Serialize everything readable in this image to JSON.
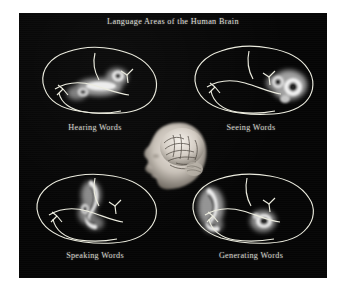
{
  "figure": {
    "title": "Language Areas of the Human Brain",
    "background_color": "#ffffff",
    "panel_color": "#050505",
    "text_color": "#d8d8d0",
    "activation_color": "#ffffff",
    "outline_color": "#e8e8e0"
  },
  "panels": [
    {
      "id": "hearing-words",
      "caption": "Hearing Words",
      "position": "top-left",
      "brain_view": "left lateral sagittal outline",
      "activation_region": "superior temporal gyrus / auditory cortex",
      "activation_location": "mid-posterior temporal, extending along sylvian fissure"
    },
    {
      "id": "seeing-words",
      "caption": "Seeing Words",
      "position": "top-right",
      "brain_view": "left lateral sagittal outline",
      "activation_region": "occipital visual cortex",
      "activation_location": "posterior pole, two ring-shaped foci"
    },
    {
      "id": "speaking-words",
      "caption": "Speaking Words",
      "position": "bottom-left",
      "brain_view": "left lateral sagittal outline",
      "activation_region": "primary motor and sensory cortex (mouth area)",
      "activation_location": "central sulcus strip, superior-mid"
    },
    {
      "id": "generating-words",
      "caption": "Generating Words",
      "position": "bottom-right",
      "brain_view": "left lateral sagittal outline",
      "activation_region": "Broca's area / inferior frontal gyrus plus posterior temporal",
      "activation_location": "anterior frontal focus and mid-temporal focus"
    }
  ],
  "center_image": {
    "id": "head-brain-render",
    "description": "3D rendered human head in left profile with cortical surface exposed",
    "facing": "left"
  }
}
